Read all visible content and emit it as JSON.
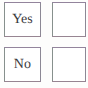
{
  "form": {
    "kind": "yes-no-checkbox-pair",
    "background_color": "#fdfdfc",
    "box_fill_color": "#ffffff",
    "box_border_color": "#8a8a8e",
    "label_text_color": "#3a3a3e",
    "rows": [
      {
        "label": "Yes",
        "checkbox_value": "",
        "checked": false
      },
      {
        "label": "No",
        "checkbox_value": "",
        "checked": false
      }
    ]
  }
}
